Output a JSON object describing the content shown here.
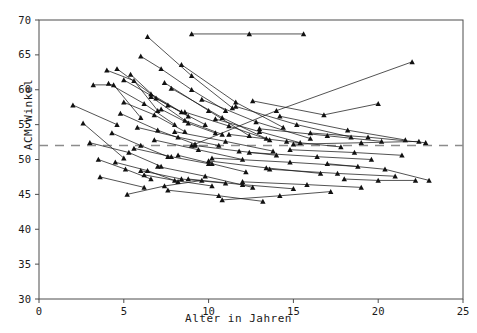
{
  "chart_data": {
    "type": "line",
    "title": "",
    "xlabel": "Alter in Jahren",
    "ylabel": "ACM-Winkel",
    "xlim": [
      0,
      25
    ],
    "ylim": [
      30,
      70
    ],
    "xticks": [
      0,
      5,
      10,
      15,
      20,
      25
    ],
    "yticks": [
      30,
      35,
      40,
      45,
      50,
      55,
      60,
      65,
      70
    ],
    "grid": false,
    "legend": null,
    "marker": "triangle",
    "line_color": "#1a1a1a",
    "reference_line": {
      "orientation": "horizontal",
      "value": 52,
      "style": "dashed",
      "color": "#8c8c8c"
    },
    "series": [
      {
        "name": "P01",
        "x": [
          2.0,
          4.6
        ],
        "y": [
          57.8,
          55.0
        ]
      },
      {
        "name": "P02",
        "x": [
          2.6,
          5.0
        ],
        "y": [
          55.2,
          50.2
        ]
      },
      {
        "name": "P03",
        "x": [
          3.2,
          4.4,
          6.0
        ],
        "y": [
          60.7,
          60.7,
          56.0
        ]
      },
      {
        "name": "P04",
        "x": [
          3.0,
          5.3,
          7.2
        ],
        "y": [
          52.4,
          51.0,
          49.0
        ]
      },
      {
        "name": "P05",
        "x": [
          3.5,
          5.1,
          6.6
        ],
        "y": [
          50.0,
          48.6,
          47.2
        ]
      },
      {
        "name": "P06",
        "x": [
          3.6,
          6.2
        ],
        "y": [
          47.5,
          46.0
        ]
      },
      {
        "name": "P07",
        "x": [
          4.0,
          5.6,
          7.0
        ],
        "y": [
          62.8,
          61.3,
          57.0
        ]
      },
      {
        "name": "P08",
        "x": [
          4.1,
          6.2,
          8.0
        ],
        "y": [
          60.9,
          58.0,
          55.0
        ]
      },
      {
        "name": "P09",
        "x": [
          4.3,
          6.0,
          7.6
        ],
        "y": [
          53.8,
          52.0,
          50.4
        ]
      },
      {
        "name": "P10",
        "x": [
          4.5,
          6.4,
          8.2
        ],
        "y": [
          49.6,
          48.4,
          46.8
        ]
      },
      {
        "name": "P11",
        "x": [
          4.8,
          7.0,
          9.2
        ],
        "y": [
          56.6,
          54.2,
          52.2
        ]
      },
      {
        "name": "P12",
        "x": [
          5.0,
          6.8,
          8.6
        ],
        "y": [
          58.2,
          56.4,
          54.0
        ]
      },
      {
        "name": "P13",
        "x": [
          5.2,
          7.4,
          9.6
        ],
        "y": [
          45.0,
          46.2,
          47.0
        ]
      },
      {
        "name": "P14",
        "x": [
          5.4,
          6.9,
          8.8
        ],
        "y": [
          62.2,
          58.8,
          56.2
        ]
      },
      {
        "name": "P15",
        "x": [
          5.6,
          7.8,
          10.0
        ],
        "y": [
          51.6,
          50.4,
          49.4
        ]
      },
      {
        "name": "P16",
        "x": [
          5.8,
          8.2,
          10.6
        ],
        "y": [
          54.6,
          53.2,
          52.0
        ]
      },
      {
        "name": "P17",
        "x": [
          6.0,
          7.2,
          9.0,
          11.0
        ],
        "y": [
          64.8,
          63.0,
          60.0,
          57.0
        ]
      },
      {
        "name": "P18",
        "x": [
          6.2,
          8.0,
          10.2
        ],
        "y": [
          47.8,
          47.0,
          46.2
        ]
      },
      {
        "name": "P19",
        "x": [
          6.4,
          9.0,
          11.4
        ],
        "y": [
          67.6,
          62.0,
          57.4
        ]
      },
      {
        "name": "P20",
        "x": [
          6.6,
          8.6,
          10.8
        ],
        "y": [
          59.0,
          55.6,
          53.6
        ]
      },
      {
        "name": "P21",
        "x": [
          6.8,
          9.4,
          12.0
        ],
        "y": [
          52.8,
          51.4,
          50.0
        ]
      },
      {
        "name": "P22",
        "x": [
          7.0,
          9.8,
          12.6
        ],
        "y": [
          49.0,
          47.6,
          46.0
        ]
      },
      {
        "name": "P23",
        "x": [
          7.2,
          8.8,
          10.4
        ],
        "y": [
          57.2,
          55.2,
          53.8
        ]
      },
      {
        "name": "P24",
        "x": [
          7.4,
          10.0,
          12.4
        ],
        "y": [
          61.0,
          57.0,
          53.4
        ]
      },
      {
        "name": "P25",
        "x": [
          7.6,
          10.6,
          13.2
        ],
        "y": [
          45.6,
          44.8,
          44.0
        ]
      },
      {
        "name": "P26",
        "x": [
          8.0,
          11.0,
          13.8
        ],
        "y": [
          54.0,
          52.6,
          51.2
        ]
      },
      {
        "name": "P27",
        "x": [
          8.2,
          10.2,
          12.2
        ],
        "y": [
          50.6,
          49.4,
          48.2
        ]
      },
      {
        "name": "P28",
        "x": [
          8.4,
          11.6,
          14.4
        ],
        "y": [
          63.6,
          58.2,
          54.6
        ]
      },
      {
        "name": "P29",
        "x": [
          8.6,
          11.2,
          13.6
        ],
        "y": [
          56.8,
          54.8,
          52.8
        ]
      },
      {
        "name": "P30",
        "x": [
          8.8,
          12.0,
          15.0
        ],
        "y": [
          47.2,
          46.4,
          45.8
        ]
      },
      {
        "name": "P31",
        "x": [
          9.0,
          12.4,
          15.6
        ],
        "y": [
          68.0,
          68.0,
          68.0
        ]
      },
      {
        "name": "P32",
        "x": [
          9.2,
          11.8,
          14.0
        ],
        "y": [
          52.0,
          51.2,
          50.6
        ]
      },
      {
        "name": "P33",
        "x": [
          9.6,
          12.8,
          16.0
        ],
        "y": [
          58.6,
          55.4,
          53.0
        ]
      },
      {
        "name": "P34",
        "x": [
          10.0,
          13.4,
          16.6
        ],
        "y": [
          49.8,
          48.8,
          48.0
        ]
      },
      {
        "name": "P35",
        "x": [
          10.4,
          13.0,
          15.4
        ],
        "y": [
          55.8,
          54.0,
          52.4
        ]
      },
      {
        "name": "P36",
        "x": [
          10.8,
          14.2,
          17.2
        ],
        "y": [
          44.2,
          44.8,
          45.4
        ]
      },
      {
        "name": "P37",
        "x": [
          11.2,
          14.6,
          17.8
        ],
        "y": [
          53.6,
          52.6,
          51.8
        ]
      },
      {
        "name": "P38",
        "x": [
          11.6,
          15.2,
          18.4
        ],
        "y": [
          57.6,
          55.0,
          53.2
        ]
      },
      {
        "name": "P39",
        "x": [
          12.0,
          15.8,
          19.0
        ],
        "y": [
          46.8,
          46.4,
          46.0
        ]
      },
      {
        "name": "P40",
        "x": [
          12.4,
          16.4,
          19.6
        ],
        "y": [
          51.0,
          50.4,
          50.0
        ]
      },
      {
        "name": "P41",
        "x": [
          13.0,
          17.0,
          20.2
        ],
        "y": [
          54.4,
          53.4,
          52.6
        ]
      },
      {
        "name": "P42",
        "x": [
          13.6,
          17.6,
          21.0
        ],
        "y": [
          48.6,
          48.0,
          47.6
        ]
      },
      {
        "name": "P43",
        "x": [
          14.2,
          18.2,
          21.6
        ],
        "y": [
          56.2,
          54.2,
          52.8
        ]
      },
      {
        "name": "P44",
        "x": [
          15.0,
          19.0,
          22.4
        ],
        "y": [
          52.2,
          52.4,
          52.6
        ]
      },
      {
        "name": "P45",
        "x": [
          9.0,
          14.0,
          22.0
        ],
        "y": [
          52.0,
          57.0,
          64.0
        ]
      },
      {
        "name": "P46",
        "x": [
          16.0,
          19.4,
          22.8
        ],
        "y": [
          53.8,
          53.2,
          52.4
        ]
      },
      {
        "name": "P47",
        "x": [
          12.6,
          16.8,
          20.0
        ],
        "y": [
          58.4,
          56.4,
          58.0
        ]
      },
      {
        "name": "P48",
        "x": [
          17.0,
          20.4,
          23.0
        ],
        "y": [
          49.4,
          48.6,
          47.0
        ]
      },
      {
        "name": "P49",
        "x": [
          18.0,
          20.0,
          22.2
        ],
        "y": [
          47.2,
          47.0,
          47.0
        ]
      },
      {
        "name": "P50",
        "x": [
          14.8,
          18.6,
          21.4
        ],
        "y": [
          51.4,
          51.0,
          50.6
        ]
      },
      {
        "name": "P51",
        "x": [
          5.0,
          7.6,
          9.8
        ],
        "y": [
          61.4,
          57.8,
          55.0
        ]
      },
      {
        "name": "P52",
        "x": [
          6.0,
          8.4,
          11.0
        ],
        "y": [
          48.4,
          47.2,
          46.6
        ]
      },
      {
        "name": "P53",
        "x": [
          7.8,
          10.8,
          13.4
        ],
        "y": [
          60.2,
          56.0,
          53.0
        ]
      },
      {
        "name": "P54",
        "x": [
          4.6,
          6.6,
          8.4
        ],
        "y": [
          63.0,
          59.4,
          56.8
        ]
      },
      {
        "name": "P55",
        "x": [
          10.2,
          14.8,
          18.8
        ],
        "y": [
          50.2,
          49.6,
          49.0
        ]
      }
    ]
  },
  "axes": {
    "x_tick_labels": [
      "0",
      "5",
      "10",
      "15",
      "20",
      "25"
    ],
    "y_tick_labels": [
      "30",
      "35",
      "40",
      "45",
      "50",
      "55",
      "60",
      "65",
      "70"
    ]
  }
}
